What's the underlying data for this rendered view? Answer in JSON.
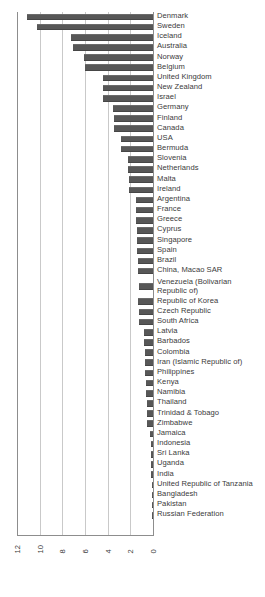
{
  "chart_data": {
    "type": "bar",
    "orientation": "horizontal",
    "title": "",
    "xlabel": "",
    "ylabel": "",
    "xlim": [
      12,
      0
    ],
    "x_reversed": true,
    "grid": true,
    "legend": false,
    "bar_color": "#575757",
    "grid_color": "#c9c9c9",
    "axis_color": "#8d8d8d",
    "xticks": [
      "12",
      "10",
      "8",
      "6",
      "4",
      "2",
      "0"
    ],
    "xtick_values": [
      12,
      10,
      8,
      6,
      4,
      2,
      0
    ],
    "categories": [
      "Denmark",
      "Sweden",
      "Iceland",
      "Australia",
      "Norway",
      "Belgium",
      "United Kingdom",
      "New Zealand",
      "Israel",
      "Germany",
      "Finland",
      "Canada",
      "USA",
      "Bermuda",
      "Slovenia",
      "Netherlands",
      "Malta",
      "Ireland",
      "Argentina",
      "France",
      "Greece",
      "Cyprus",
      "Singapore",
      "Spain",
      "Brazil",
      "China, Macao SAR",
      "Venezuela (Bolivarian\nRepublic of)",
      "Republic of Korea",
      "Czech Republic",
      "South Africa",
      "Latvia",
      "Barbados",
      "Colombia",
      "Iran (Islamic Republic of)",
      "Philippines",
      "Kenya",
      "Namibia",
      "Thailand",
      "Trinidad & Tobago",
      "Zimbabwe",
      "Jamaica",
      "Indonesia",
      "Sri Lanka",
      "Uganda",
      "India",
      "United Republic of Tanzania",
      "Bangladesh",
      "Pakistan",
      "Russian Federation"
    ],
    "values": [
      11.1,
      10.2,
      7.2,
      7.1,
      6.1,
      6.0,
      4.4,
      4.4,
      4.4,
      3.5,
      3.4,
      3.4,
      2.8,
      2.8,
      2.2,
      2.2,
      2.1,
      2.1,
      1.5,
      1.5,
      1.5,
      1.4,
      1.4,
      1.4,
      1.3,
      1.3,
      1.2,
      1.3,
      1.2,
      1.2,
      0.8,
      0.8,
      0.7,
      0.7,
      0.7,
      0.6,
      0.6,
      0.5,
      0.5,
      0.5,
      0.25,
      0.2,
      0.2,
      0.2,
      0.15,
      0.12,
      0.1,
      0.08,
      0.06
    ],
    "two_line_categories": [
      "Venezuela (Bolivarian\nRepublic of)"
    ]
  }
}
